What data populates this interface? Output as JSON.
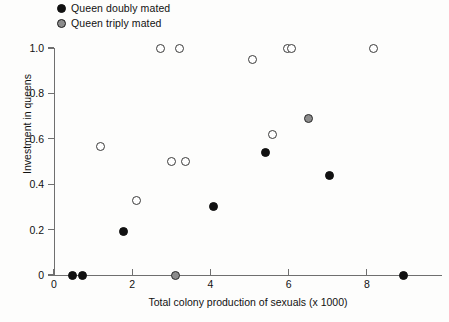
{
  "chart_data": {
    "type": "scatter",
    "title": "",
    "xlabel": "Total colony production of sexuals (x 1000)",
    "ylabel": "Investment in queens",
    "xlim": [
      0,
      9.95
    ],
    "ylim": [
      0,
      1.0
    ],
    "xticks": [
      "0",
      "2",
      "4",
      "6",
      "8"
    ],
    "xtick_values": [
      0,
      2,
      4,
      6,
      8
    ],
    "yticks": [
      "0",
      "0.2",
      "0.4",
      "0.6",
      "0.8",
      "1.0"
    ],
    "ytick_values": [
      0,
      0.2,
      0.4,
      0.6,
      0.8,
      1.0
    ],
    "grid": false,
    "legend_position": "top-left-outside",
    "series": [
      {
        "name": "Queen doubly mated",
        "marker": "filled-circle",
        "color": "#111111",
        "points": [
          {
            "x": 0.48,
            "y": 0.0
          },
          {
            "x": 0.74,
            "y": 0.0
          },
          {
            "x": 1.77,
            "y": 0.19
          },
          {
            "x": 4.08,
            "y": 0.3
          },
          {
            "x": 5.4,
            "y": 0.54
          },
          {
            "x": 7.05,
            "y": 0.44
          },
          {
            "x": 8.95,
            "y": 0.0
          }
        ]
      },
      {
        "name": "Queen triply mated",
        "marker": "open-circle",
        "color": "#8c8c8c",
        "points": [
          {
            "x": 1.18,
            "y": 0.565
          },
          {
            "x": 2.1,
            "y": 0.33
          },
          {
            "x": 3.0,
            "y": 0.5
          },
          {
            "x": 3.37,
            "y": 0.5
          },
          {
            "x": 3.1,
            "y": 0.0,
            "filled": true
          },
          {
            "x": 2.72,
            "y": 1.0
          },
          {
            "x": 3.2,
            "y": 1.0
          },
          {
            "x": 5.08,
            "y": 0.95
          },
          {
            "x": 5.6,
            "y": 0.62
          },
          {
            "x": 5.98,
            "y": 1.0
          },
          {
            "x": 6.5,
            "y": 0.69,
            "filled": true
          },
          {
            "x": 6.08,
            "y": 1.0
          },
          {
            "x": 8.18,
            "y": 1.0
          }
        ]
      }
    ]
  },
  "legend": {
    "items": [
      {
        "label": "Queen doubly mated",
        "marker": "filled-circle"
      },
      {
        "label": "Queen triply mated",
        "marker": "gray-circle"
      }
    ]
  }
}
